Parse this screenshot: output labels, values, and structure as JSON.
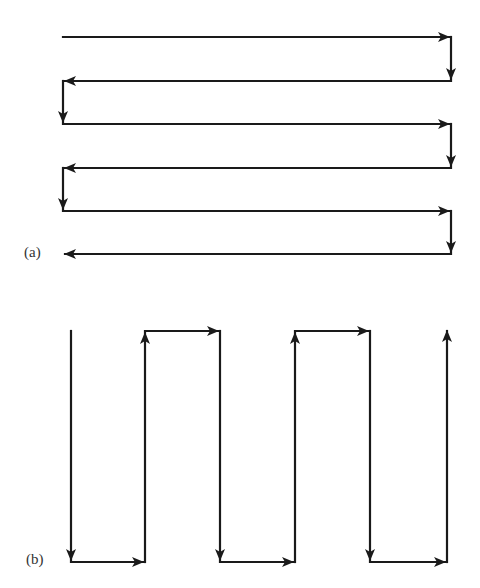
{
  "figure": {
    "stroke_color": "#1a1a1a",
    "label_color": "#333333",
    "panel_a": {
      "label": "(a)",
      "label_pos": [
        24,
        244
      ],
      "description": "horizontal raster (boustrophedon) scan path",
      "segments": [
        {
          "from": [
            63,
            37
          ],
          "to": [
            449,
            37
          ],
          "arrow": true
        },
        {
          "from": [
            451,
            37
          ],
          "to": [
            451,
            79
          ],
          "arrow": true
        },
        {
          "from": [
            451,
            81
          ],
          "to": [
            65,
            81
          ],
          "arrow": true
        },
        {
          "from": [
            63,
            81
          ],
          "to": [
            63,
            122
          ],
          "arrow": true
        },
        {
          "from": [
            63,
            124
          ],
          "to": [
            449,
            124
          ],
          "arrow": true
        },
        {
          "from": [
            451,
            124
          ],
          "to": [
            451,
            166
          ],
          "arrow": true
        },
        {
          "from": [
            451,
            168
          ],
          "to": [
            65,
            168
          ],
          "arrow": true
        },
        {
          "from": [
            63,
            168
          ],
          "to": [
            63,
            209
          ],
          "arrow": true
        },
        {
          "from": [
            63,
            211
          ],
          "to": [
            449,
            211
          ],
          "arrow": true
        },
        {
          "from": [
            451,
            211
          ],
          "to": [
            451,
            252
          ],
          "arrow": true
        },
        {
          "from": [
            451,
            254
          ],
          "to": [
            65,
            254
          ],
          "arrow": true
        }
      ]
    },
    "panel_b": {
      "label": "(b)",
      "label_pos": [
        26,
        551
      ],
      "description": "vertical raster (boustrophedon) scan path",
      "segments": [
        {
          "from": [
            71,
            331
          ],
          "to": [
            71,
            560
          ],
          "arrow": true
        },
        {
          "from": [
            71,
            562
          ],
          "to": [
            143,
            562
          ],
          "arrow": true
        },
        {
          "from": [
            145,
            562
          ],
          "to": [
            145,
            333
          ],
          "arrow": true
        },
        {
          "from": [
            145,
            331
          ],
          "to": [
            218,
            331
          ],
          "arrow": true
        },
        {
          "from": [
            220,
            331
          ],
          "to": [
            220,
            560
          ],
          "arrow": true
        },
        {
          "from": [
            220,
            562
          ],
          "to": [
            293,
            562
          ],
          "arrow": true
        },
        {
          "from": [
            295,
            562
          ],
          "to": [
            295,
            333
          ],
          "arrow": true
        },
        {
          "from": [
            295,
            331
          ],
          "to": [
            368,
            331
          ],
          "arrow": true
        },
        {
          "from": [
            370,
            331
          ],
          "to": [
            370,
            560
          ],
          "arrow": true
        },
        {
          "from": [
            370,
            562
          ],
          "to": [
            445,
            562
          ],
          "arrow": true
        },
        {
          "from": [
            447,
            562
          ],
          "to": [
            447,
            331
          ],
          "arrow": true
        }
      ]
    }
  }
}
